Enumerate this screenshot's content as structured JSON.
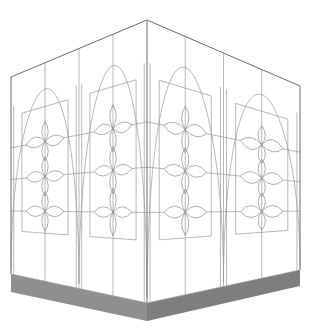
{
  "figure": {
    "title": "Isometric box with ornamental quatrefoil panels",
    "colors": {
      "background": "#ffffff",
      "line": "#6a6a6a",
      "ornament": "#8c8c8c",
      "base": "#8f8f8f",
      "base_dark": "#7e7e7e"
    },
    "faces": [
      {
        "name": "left-face",
        "panels": 2,
        "ornaments_per_panel": 3
      },
      {
        "name": "right-face",
        "panels": 2,
        "ornaments_per_panel": 3
      }
    ],
    "base_label": "plinth"
  }
}
